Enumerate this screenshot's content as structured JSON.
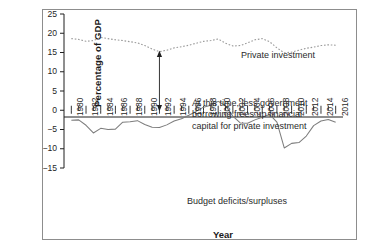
{
  "chart_data": {
    "type": "line",
    "title": "",
    "xlabel": "Year",
    "ylabel": "Percentage of GDP",
    "xlim": [
      1979,
      2017
    ],
    "ylim": [
      -15,
      25
    ],
    "ytick_labels": [
      "25",
      "20",
      "15",
      "10",
      "5",
      "0",
      "−5",
      "−10",
      "−15"
    ],
    "ytick_values": [
      25,
      20,
      15,
      10,
      5,
      0,
      -5,
      -10,
      -15
    ],
    "xtick_labels": [
      "1980",
      "1982",
      "1984",
      "1986",
      "1988",
      "1990",
      "1992",
      "1994",
      "1996",
      "1998",
      "2000",
      "2002",
      "2004",
      "2006",
      "2008",
      "2010",
      "2012",
      "2014",
      "2016"
    ],
    "xtick_values": [
      1980,
      1982,
      1984,
      1986,
      1988,
      1990,
      1992,
      1994,
      1996,
      1998,
      2000,
      2002,
      2004,
      2006,
      2008,
      2010,
      2012,
      2014,
      2016
    ],
    "minor_tick_interval": 1,
    "grid": false,
    "legend": "inline-labels",
    "series": [
      {
        "name": "Private investment",
        "style": "dotted",
        "x": [
          1980,
          1981,
          1982,
          1983,
          1984,
          1985,
          1986,
          1987,
          1988,
          1989,
          1990,
          1991,
          1992,
          1993,
          1994,
          1995,
          1996,
          1997,
          1998,
          1999,
          2000,
          2001,
          2002,
          2003,
          2004,
          2005,
          2006,
          2007,
          2008,
          2009,
          2010,
          2011,
          2012,
          2013,
          2014,
          2015,
          2016
        ],
        "values": [
          18.6,
          18.4,
          17.9,
          18.1,
          18.9,
          18.6,
          18.3,
          18.1,
          17.8,
          17.5,
          16.8,
          15.9,
          15.2,
          15.6,
          16.2,
          16.5,
          16.9,
          17.4,
          17.9,
          18.1,
          18.5,
          17.4,
          16.7,
          16.8,
          17.5,
          18.3,
          18.6,
          17.8,
          16.2,
          14.9,
          15.1,
          15.6,
          16.1,
          16.4,
          16.8,
          17.0,
          16.9
        ]
      },
      {
        "name": "Budget deficits/surpluses",
        "style": "solid",
        "x": [
          1980,
          1981,
          1982,
          1983,
          1984,
          1985,
          1986,
          1987,
          1988,
          1989,
          1990,
          1991,
          1992,
          1993,
          1994,
          1995,
          1996,
          1997,
          1998,
          1999,
          2000,
          2001,
          2002,
          2003,
          2004,
          2005,
          2006,
          2007,
          2008,
          2009,
          2010,
          2011,
          2012,
          2013,
          2014,
          2015,
          2016
        ],
        "values": [
          -2.6,
          -2.5,
          -3.9,
          -5.9,
          -4.7,
          -5.0,
          -4.9,
          -3.1,
          -3.0,
          -2.7,
          -3.7,
          -4.4,
          -4.5,
          -3.8,
          -2.8,
          -2.2,
          -1.3,
          -0.3,
          0.8,
          1.3,
          2.3,
          1.2,
          -1.5,
          -3.3,
          -3.4,
          -2.5,
          -1.8,
          -1.1,
          -3.1,
          -9.8,
          -8.6,
          -8.4,
          -6.7,
          -4.0,
          -2.8,
          -2.4,
          -3.1
        ]
      }
    ],
    "annotations": [
      {
        "name": "private-investment-label",
        "text": "Private investment",
        "x": 2000,
        "y": 22
      },
      {
        "name": "budget-deficits-label",
        "text": "Budget deficits/surpluses",
        "x": 1997,
        "y": -9.5
      },
      {
        "name": "callout-note",
        "lines": [
          "At this time, less government",
          "borrowing frees up financial",
          "capital for private investment"
        ],
        "arrow": {
          "name": "double-headed-arrow",
          "x": 1992,
          "y_from": 0,
          "y_to": 15.2,
          "heads": "both"
        }
      }
    ],
    "colors": {
      "axis": "#1f1f1f",
      "private_investment_line": "#9a9a9a",
      "budget_line": "#7d7d7d",
      "frame": "#8d8d8d",
      "text": "#1f1f1f"
    }
  }
}
